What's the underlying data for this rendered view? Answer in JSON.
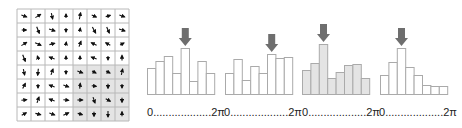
{
  "figure": {
    "grid": {
      "rows": 8,
      "cols": 8,
      "x": 17,
      "y": 9,
      "cell": 14,
      "line_color": "#b8b8b8",
      "shade_color": "#e4e4e4",
      "shaded_region": {
        "col_start": 4,
        "row_start": 4,
        "cols": 4,
        "rows": 4
      },
      "arrow_color": "#111111",
      "arrows": [
        [
          [
            0.8,
            0.3
          ],
          [
            0.8,
            -0.5
          ],
          [
            0.2,
            0.9
          ],
          [
            0,
            -0.6
          ],
          [
            0.2,
            -1.0
          ],
          [
            0.7,
            0.3
          ],
          [
            0.7,
            -0.2
          ],
          [
            0.8,
            0.3
          ]
        ],
        [
          [
            0.7,
            0
          ],
          [
            0.4,
            1.0
          ],
          [
            0.9,
            0.3
          ],
          [
            0,
            0.6
          ],
          [
            0.1,
            -0.6
          ],
          [
            0.5,
            0.9
          ],
          [
            0.4,
            0.9
          ],
          [
            0.9,
            0.3
          ]
        ],
        [
          [
            0.8,
            -0.5
          ],
          [
            0.9,
            0.4
          ],
          [
            0.8,
            -0.2
          ],
          [
            0.1,
            -0.6
          ],
          [
            0.3,
            -0.8
          ],
          [
            -0.8,
            -0.4
          ],
          [
            -0.7,
            -0.4
          ],
          [
            0.6,
            -0.3
          ]
        ],
        [
          [
            0.4,
            1.0
          ],
          [
            -0.2,
            -0.6
          ],
          [
            -0.8,
            -0.3
          ],
          [
            0,
            -0.6
          ],
          [
            0,
            -0.6
          ],
          [
            -0.8,
            -0.3
          ],
          [
            0,
            0.6
          ],
          [
            0,
            -0.8
          ]
        ],
        [
          [
            0.2,
            0.9
          ],
          [
            -0.1,
            1.0
          ],
          [
            0.3,
            -0.9
          ],
          [
            0,
            0.6
          ],
          [
            0.8,
            0.3
          ],
          [
            0.6,
            0.3
          ],
          [
            0.6,
            0.3
          ],
          [
            0.2,
            -0.9
          ]
        ],
        [
          [
            0.4,
            -0.8
          ],
          [
            0,
            0.6
          ],
          [
            -0.8,
            -0.3
          ],
          [
            0.8,
            0.3
          ],
          [
            0.1,
            -0.8
          ],
          [
            0.7,
            0.1
          ],
          [
            0,
            0.7
          ],
          [
            0,
            0.6
          ]
        ],
        [
          [
            0.8,
            -0.1
          ],
          [
            0.3,
            -0.9
          ],
          [
            -0.8,
            -0.3
          ],
          [
            0.8,
            0.1
          ],
          [
            0.8,
            0
          ],
          [
            0.3,
            0.9
          ],
          [
            0.7,
            0.4
          ],
          [
            0,
            0.7
          ]
        ],
        [
          [
            0.7,
            -0.4
          ],
          [
            0.8,
            0.2
          ],
          [
            0.8,
            0.3
          ],
          [
            0.8,
            -0.4
          ],
          [
            0.7,
            0.2
          ],
          [
            0,
            0.7
          ],
          [
            0,
            0.9
          ],
          [
            0,
            -0.7
          ]
        ]
      ]
    },
    "histograms": [
      {
        "id": "h1",
        "x": 147,
        "shaded": false,
        "peak_bin": 4,
        "bars": [
          26,
          33,
          38,
          21,
          46,
          13,
          33,
          21
        ]
      },
      {
        "id": "h2",
        "x": 225,
        "shaded": false,
        "peak_bin": 5,
        "bars": [
          21,
          35,
          14,
          28,
          21,
          40,
          36,
          37
        ]
      },
      {
        "id": "h3",
        "x": 302,
        "shaded": true,
        "peak_bin": 2,
        "bars": [
          24,
          31,
          50,
          16,
          22,
          29,
          30,
          16
        ]
      },
      {
        "id": "h4",
        "x": 380,
        "shaded": false,
        "peak_bin": 2,
        "bars": [
          19,
          32,
          46,
          27,
          19,
          9,
          8,
          8
        ]
      }
    ],
    "hist_style": {
      "baseline_y": 94,
      "bar_width": 8.4,
      "bar_stroke": "#aaaaaa",
      "bar_fill": "#ffffff",
      "bar_fill_shaded": "#e4e4e4",
      "arrow_color": "#6e6e6e"
    },
    "axis_labels": [
      {
        "start": "0",
        "dots": "...................",
        "end": "2π"
      },
      {
        "start": "0",
        "dots": "...................",
        "end": "2π"
      },
      {
        "start": "0",
        "dots": "...................",
        "end": "2π"
      },
      {
        "start": "0",
        "dots": "...................",
        "end": "2π"
      }
    ]
  },
  "chart_data": {
    "type": "bar",
    "title": "",
    "xlabel": "orientation (0 to 2π)",
    "ylabel": "",
    "categories": [
      "bin1",
      "bin2",
      "bin3",
      "bin4",
      "bin5",
      "bin6",
      "bin7",
      "bin8"
    ],
    "series": [
      {
        "name": "histogram 1",
        "values": [
          26,
          33,
          38,
          21,
          46,
          13,
          33,
          21
        ],
        "peak": "bin5"
      },
      {
        "name": "histogram 2",
        "values": [
          21,
          35,
          14,
          28,
          21,
          40,
          36,
          37
        ],
        "peak": "bin6"
      },
      {
        "name": "histogram 3 (shaded)",
        "values": [
          24,
          31,
          50,
          16,
          22,
          29,
          30,
          16
        ],
        "peak": "bin3"
      },
      {
        "name": "histogram 4",
        "values": [
          19,
          32,
          46,
          27,
          19,
          9,
          8,
          8
        ],
        "peak": "bin3"
      }
    ],
    "x_tick_labels": [
      "0",
      "2π"
    ],
    "grid": false,
    "legend": "none"
  }
}
